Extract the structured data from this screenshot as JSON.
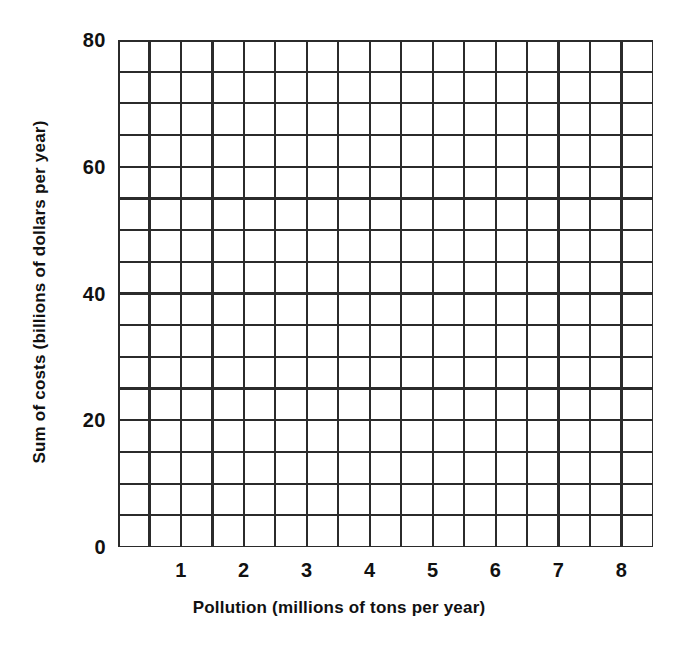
{
  "chart_data": {
    "type": "scatter",
    "title": "",
    "subtitle": "",
    "xlabel": "Pollution (millions of tons per year)",
    "ylabel": "Sum of costs (billions of dollars per year)",
    "xlim": [
      0,
      8.5
    ],
    "ylim": [
      0,
      80
    ],
    "grid": true,
    "grid_x_step": 0.5,
    "grid_y_step": 5,
    "x_tick_step": 1,
    "y_tick_step": 20,
    "x_ticks": [
      {
        "value": 1,
        "label": "1"
      },
      {
        "value": 2,
        "label": "2"
      },
      {
        "value": 3,
        "label": "3"
      },
      {
        "value": 4,
        "label": "4"
      },
      {
        "value": 5,
        "label": "5"
      },
      {
        "value": 6,
        "label": "6"
      },
      {
        "value": 7,
        "label": "7"
      },
      {
        "value": 8,
        "label": "8"
      }
    ],
    "y_ticks": [
      {
        "value": 0,
        "label": "0"
      },
      {
        "value": 20,
        "label": "20"
      },
      {
        "value": 40,
        "label": "40"
      },
      {
        "value": 60,
        "label": "60"
      },
      {
        "value": 80,
        "label": "80"
      }
    ],
    "legend": [],
    "legend_position": "none",
    "annotations": [],
    "series": [],
    "x": [],
    "values": [],
    "note": "Blank graph paper grid with labeled axes; no data points are plotted."
  },
  "style": {
    "background_color": "#ffffff",
    "grid_color": "#2b2b2b",
    "axis_color": "#1a1a1a",
    "text_color": "#111111"
  }
}
